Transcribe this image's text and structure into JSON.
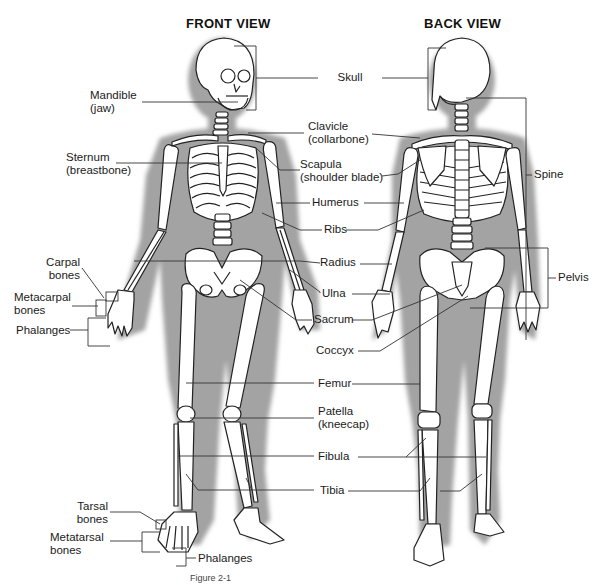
{
  "diagram": {
    "type": "anatomical-skeleton",
    "views": [
      {
        "id": "front",
        "title": "FRONT VIEW"
      },
      {
        "id": "back",
        "title": "BACK VIEW"
      }
    ],
    "colors": {
      "background": "#ffffff",
      "shadow": "#a3a3a3",
      "bone_fill": "#ffffff",
      "bone_outline": "#222222",
      "leader_line": "#333333",
      "text": "#1a1a1a"
    },
    "labels": {
      "skull": "Skull",
      "mandible_l1": "Mandible",
      "mandible_l2": "(jaw)",
      "clavicle_l1": "Clavicle",
      "clavicle_l2": "(collarbone)",
      "sternum_l1": "Sternum",
      "sternum_l2": "(breastbone)",
      "scapula_l1": "Scapula",
      "scapula_l2": "(shoulder blade)",
      "spine": "Spine",
      "humerus": "Humerus",
      "ribs": "Ribs",
      "radius": "Radius",
      "pelvis": "Pelvis",
      "carpal_l1": "Carpal",
      "carpal_l2": "bones",
      "metacarpal_l1": "Metacarpal",
      "metacarpal_l2": "bones",
      "phalanges_hand": "Phalanges",
      "ulna": "Ulna",
      "sacrum": "Sacrum",
      "coccyx": "Coccyx",
      "femur": "Femur",
      "patella_l1": "Patella",
      "patella_l2": "(kneecap)",
      "fibula": "Fibula",
      "tibia": "Tibia",
      "tarsal_l1": "Tarsal",
      "tarsal_l2": "bones",
      "metatarsal_l1": "Metatarsal",
      "metatarsal_l2": "bones",
      "phalanges_foot": "Phalanges"
    },
    "caption": "Figure 2-1"
  }
}
